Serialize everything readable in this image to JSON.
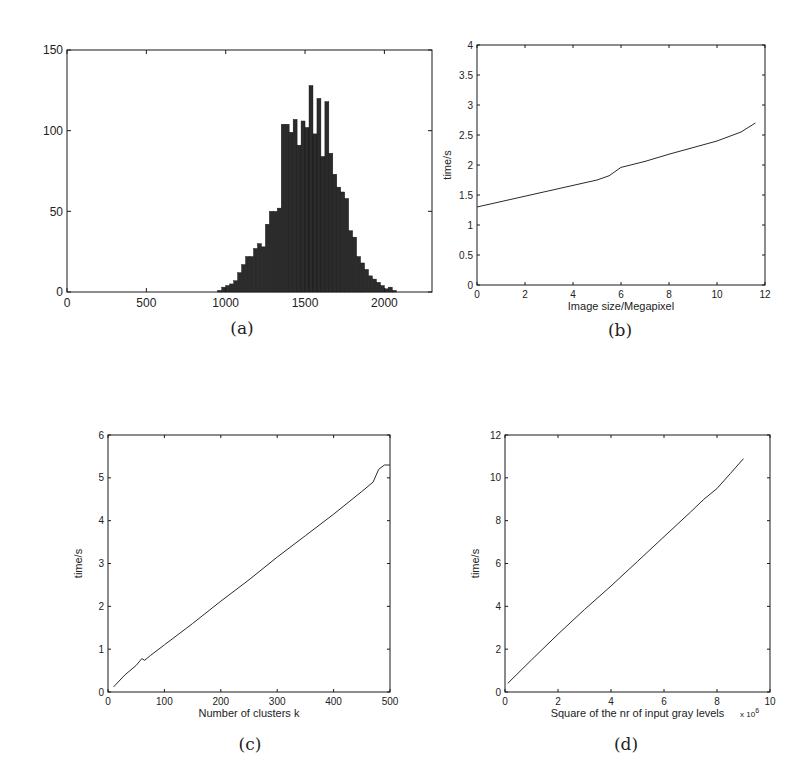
{
  "chart_data": [
    {
      "id": "a",
      "type": "bar",
      "caption": "(a)",
      "title": "",
      "xlabel": "",
      "ylabel": "",
      "xlim": [
        0,
        2300
      ],
      "ylim": [
        0,
        150
      ],
      "xticks": [
        0,
        500,
        1000,
        1500,
        2000
      ],
      "yticks": [
        0,
        50,
        100,
        150
      ],
      "grid": false,
      "bin_width": 25,
      "bins_start": [
        950,
        975,
        1000,
        1025,
        1050,
        1075,
        1100,
        1125,
        1150,
        1175,
        1200,
        1225,
        1250,
        1275,
        1300,
        1325,
        1350,
        1375,
        1400,
        1425,
        1450,
        1475,
        1500,
        1525,
        1550,
        1575,
        1600,
        1625,
        1650,
        1675,
        1700,
        1725,
        1750,
        1775,
        1800,
        1825,
        1850,
        1875,
        1900,
        1925,
        1950,
        1975,
        2000,
        2025,
        2050
      ],
      "values": [
        1,
        3,
        4,
        5,
        7,
        12,
        17,
        22,
        22,
        27,
        30,
        28,
        42,
        50,
        50,
        52,
        104,
        104,
        99,
        107,
        91,
        106,
        102,
        128,
        98,
        120,
        84,
        118,
        86,
        73,
        65,
        62,
        58,
        38,
        34,
        22,
        18,
        14,
        10,
        8,
        6,
        4,
        2,
        3,
        1
      ]
    },
    {
      "id": "b",
      "type": "line",
      "caption": "(b)",
      "title": "",
      "xlabel": "Image size/Megapixel",
      "ylabel": "time/s",
      "xlim": [
        0,
        12
      ],
      "ylim": [
        0,
        4
      ],
      "xticks": [
        0,
        2,
        4,
        6,
        8,
        10,
        12
      ],
      "yticks": [
        0,
        0.5,
        1,
        1.5,
        2,
        2.5,
        3,
        3.5,
        4
      ],
      "grid": false,
      "x": [
        0,
        1,
        2,
        3,
        4,
        5,
        5.5,
        6,
        7,
        8,
        9,
        10,
        11,
        11.6
      ],
      "y": [
        1.3,
        1.39,
        1.48,
        1.57,
        1.66,
        1.75,
        1.82,
        1.96,
        2.06,
        2.18,
        2.29,
        2.4,
        2.55,
        2.7
      ]
    },
    {
      "id": "c",
      "type": "line",
      "caption": "(c)",
      "title": "",
      "xlabel": "Number of clusters k",
      "ylabel": "time/s",
      "xlim": [
        0,
        500
      ],
      "ylim": [
        0,
        6
      ],
      "xticks": [
        0,
        100,
        200,
        300,
        400,
        500
      ],
      "yticks": [
        0,
        1,
        2,
        3,
        4,
        5,
        6
      ],
      "grid": false,
      "x": [
        10,
        30,
        50,
        60,
        65,
        75,
        100,
        150,
        200,
        250,
        300,
        350,
        400,
        450,
        470,
        480,
        490,
        500
      ],
      "y": [
        0.12,
        0.4,
        0.62,
        0.78,
        0.74,
        0.85,
        1.1,
        1.6,
        2.12,
        2.62,
        3.15,
        3.65,
        4.15,
        4.68,
        4.9,
        5.2,
        5.3,
        5.3
      ]
    },
    {
      "id": "d",
      "type": "line",
      "caption": "(d)",
      "title": "",
      "xlabel": "Square of the nr of input gray levels",
      "x_multiplier": "x 10^6",
      "ylabel": "time/s",
      "xlim": [
        0,
        10
      ],
      "ylim": [
        0,
        12
      ],
      "xticks": [
        0,
        2,
        4,
        6,
        8,
        10
      ],
      "yticks": [
        0,
        2,
        4,
        6,
        8,
        10,
        12
      ],
      "grid": false,
      "x": [
        0.1,
        1,
        2,
        3,
        4,
        5,
        6,
        7,
        7.5,
        8,
        8.5,
        9
      ],
      "y": [
        0.4,
        1.5,
        2.7,
        3.85,
        4.95,
        6.1,
        7.25,
        8.4,
        9.0,
        9.5,
        10.2,
        10.9
      ]
    }
  ],
  "captions": {
    "a": "(a)",
    "b": "(b)",
    "c": "(c)",
    "d": "(d)"
  },
  "axis_labels": {
    "b_x": "Image size/Megapixel",
    "b_y": "time/s",
    "c_x": "Number of clusters k",
    "c_y": "time/s",
    "d_x": "Square of the nr of input gray levels",
    "d_y": "time/s",
    "d_mult_base": "x 10",
    "d_mult_exp": "6"
  }
}
